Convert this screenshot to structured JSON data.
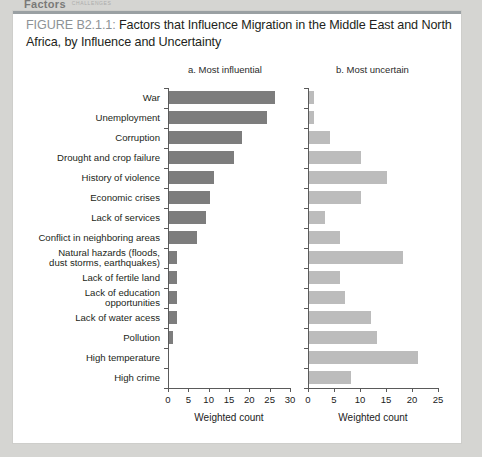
{
  "page": {
    "running_head": "Factors",
    "running_head_sub": "CHALLENGES"
  },
  "figure": {
    "number_label": "FIGURE B2.1.1:",
    "title": " Factors that Influence Migration in the Middle East and North Africa, by Influence and Uncertainty"
  },
  "panels": {
    "a_title": "a. Most influential",
    "b_title": "b. Most uncertain"
  },
  "chart_data": [
    {
      "type": "bar",
      "orientation": "horizontal",
      "title": "a. Most influential",
      "panel": "a",
      "xlabel": "Weighted count",
      "ylabel": "",
      "xlim": [
        0,
        30
      ],
      "xticks": [
        0,
        5,
        10,
        15,
        20,
        25,
        30
      ],
      "grid": false,
      "legend": "none",
      "bar_color": "#7d7d7d",
      "categories": [
        "War",
        "Unemployment",
        "Corruption",
        "Drought and crop failure",
        "History of violence",
        "Economic crises",
        "Lack of services",
        "Conflict in neighboring areas",
        "Natural hazards (floods,\ndust storms, earthquakes)",
        "Lack of fertile land",
        "Lack of education\nopportunities",
        "Lack of water acess",
        "Pollution",
        "High temperature",
        "High crime"
      ],
      "values": [
        26,
        24,
        18,
        16,
        11,
        10,
        9,
        7,
        2,
        2,
        2,
        2,
        1,
        0,
        0
      ]
    },
    {
      "type": "bar",
      "orientation": "horizontal",
      "title": "b. Most uncertain",
      "panel": "b",
      "xlabel": "Weighted count",
      "ylabel": "",
      "xlim": [
        0,
        25
      ],
      "xticks": [
        0,
        5,
        10,
        15,
        20,
        25
      ],
      "grid": false,
      "legend": "none",
      "bar_color": "#bcbcbc",
      "categories": [
        "War",
        "Unemployment",
        "Corruption",
        "Drought and crop failure",
        "History of violence",
        "Economic crises",
        "Lack of services",
        "Conflict in neighboring areas",
        "Natural hazards (floods,\ndust storms, earthquakes)",
        "Lack of fertile land",
        "Lack of education\nopportunities",
        "Lack of water acess",
        "Pollution",
        "High temperature",
        "High crime"
      ],
      "values": [
        1,
        1,
        4,
        10,
        15,
        10,
        3,
        6,
        18,
        6,
        7,
        12,
        13,
        21,
        8
      ]
    }
  ]
}
